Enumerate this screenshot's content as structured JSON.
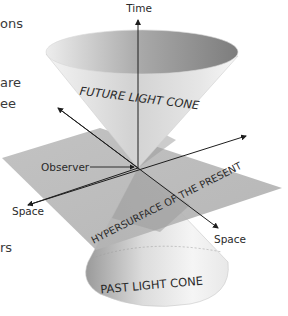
{
  "diagram": {
    "labels": {
      "time": "Time",
      "future_cone": "FUTURE LIGHT CONE",
      "past_cone": "PAST LIGHT CONE",
      "hypersurface": "HYPERSURFACE OF THE PRESENT",
      "observer": "Observer",
      "space_left": "Space",
      "space_right": "Space"
    },
    "clipped_side_text": [
      "ons",
      "are",
      "ee",
      "rs"
    ],
    "colors": {
      "background": "#ffffff",
      "plane": "#b4b4b4",
      "cone_light": "#f2f2f2",
      "cone_dark": "#8a8a8a",
      "axis": "#2b2b2b",
      "label_text": "#3a3a3a"
    }
  }
}
